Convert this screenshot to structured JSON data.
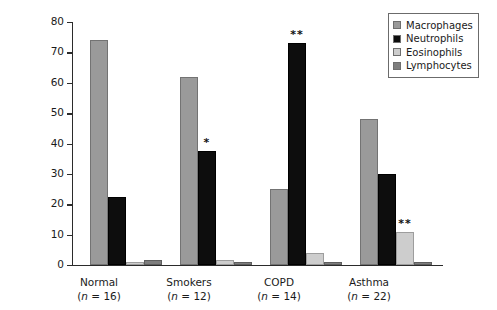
{
  "chart_data": {
    "type": "bar",
    "title": "",
    "xlabel": "",
    "ylabel": "Cell count (% total)",
    "ylim": [
      0,
      80
    ],
    "yticks": [
      0,
      10,
      20,
      30,
      40,
      50,
      60,
      70,
      80
    ],
    "grid": false,
    "legend_position": "top-right",
    "categories": [
      "Normal",
      "Smokers",
      "COPD",
      "Asthma"
    ],
    "group_sublabels": [
      "(n = 16)",
      "(n = 12)",
      "(n = 14)",
      "(n = 22)"
    ],
    "group_counts": [
      16,
      12,
      14,
      22
    ],
    "series": [
      {
        "name": "Macrophages",
        "color": "#9a9a9a",
        "values": [
          74,
          62,
          25,
          48
        ]
      },
      {
        "name": "Neutrophils",
        "color": "#0d0d0d",
        "values": [
          22.5,
          37.5,
          73,
          30
        ]
      },
      {
        "name": "Eosinophils",
        "color": "#cdcdcd",
        "values": [
          1,
          1.5,
          4,
          11
        ]
      },
      {
        "name": "Lymphocytes",
        "color": "#7e7e7e",
        "values": [
          1.5,
          1,
          1,
          1
        ]
      }
    ],
    "annotations": [
      {
        "group": "Smokers",
        "series": "Neutrophils",
        "text": "*"
      },
      {
        "group": "COPD",
        "series": "Neutrophils",
        "text": "**"
      },
      {
        "group": "Asthma",
        "series": "Eosinophils",
        "text": "**"
      }
    ]
  },
  "axis": {
    "y_title": "Cell count (% total)",
    "y_tick_labels": [
      "0",
      "10",
      "20",
      "30",
      "40",
      "50",
      "60",
      "70",
      "80"
    ]
  },
  "legend": {
    "items": [
      {
        "label": "Macrophages"
      },
      {
        "label": "Neutrophils"
      },
      {
        "label": "Eosinophils"
      },
      {
        "label": "Lymphocytes"
      }
    ]
  },
  "groups": [
    {
      "name": "Normal",
      "sub": "(n = 16)"
    },
    {
      "name": "Smokers",
      "sub": "(n = 12)"
    },
    {
      "name": "COPD",
      "sub": "(n = 14)"
    },
    {
      "name": "Asthma",
      "sub": "(n = 22)"
    }
  ]
}
